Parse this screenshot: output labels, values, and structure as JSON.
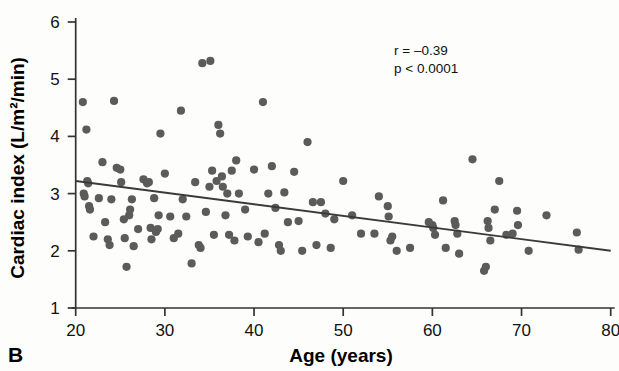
{
  "panel": {
    "label": "B"
  },
  "annotations": {
    "correlation": "r = –0.39",
    "pvalue": "p < 0.0001"
  },
  "chart_data": {
    "type": "scatter",
    "title": "",
    "xlabel": "Age (years)",
    "ylabel": "Cardiac index (L/m²/min)",
    "xlim": [
      20,
      80
    ],
    "ylim": [
      1,
      6
    ],
    "xticks": [
      20,
      30,
      40,
      50,
      60,
      70,
      80
    ],
    "xticklabels": [
      "20",
      "30",
      "40",
      "50",
      "60",
      "70",
      "80"
    ],
    "yticks": [
      1,
      2,
      3,
      4,
      5,
      6
    ],
    "yticklabels": [
      "1",
      "2",
      "3",
      "4",
      "5",
      "6"
    ],
    "grid": false,
    "legend": null,
    "marker_color": "#5b5b5b",
    "line_color": "#3a3a3a",
    "axis_color": "#333333",
    "trendline": {
      "type": "linear",
      "x": [
        20,
        80
      ],
      "y": [
        3.22,
        2.0
      ],
      "r": -0.39,
      "p": "<0.0001"
    },
    "points": [
      [
        20.8,
        4.6
      ],
      [
        20.9,
        3.0
      ],
      [
        21.0,
        2.95
      ],
      [
        21.2,
        4.12
      ],
      [
        21.3,
        3.22
      ],
      [
        21.4,
        3.18
      ],
      [
        21.5,
        2.78
      ],
      [
        21.6,
        2.72
      ],
      [
        22.0,
        2.25
      ],
      [
        22.6,
        2.92
      ],
      [
        23.0,
        3.55
      ],
      [
        23.3,
        2.5
      ],
      [
        23.6,
        2.2
      ],
      [
        23.8,
        2.1
      ],
      [
        24.0,
        2.9
      ],
      [
        24.3,
        4.62
      ],
      [
        24.6,
        3.45
      ],
      [
        25.0,
        3.42
      ],
      [
        25.1,
        3.2
      ],
      [
        25.4,
        2.55
      ],
      [
        25.5,
        2.22
      ],
      [
        25.7,
        1.72
      ],
      [
        26.0,
        2.62
      ],
      [
        26.1,
        2.72
      ],
      [
        26.3,
        2.9
      ],
      [
        26.5,
        2.08
      ],
      [
        27.0,
        2.38
      ],
      [
        27.6,
        3.25
      ],
      [
        28.0,
        3.18
      ],
      [
        28.2,
        3.2
      ],
      [
        28.4,
        2.4
      ],
      [
        28.5,
        2.2
      ],
      [
        28.8,
        2.92
      ],
      [
        29.0,
        2.33
      ],
      [
        29.2,
        2.38
      ],
      [
        29.3,
        2.62
      ],
      [
        29.5,
        4.05
      ],
      [
        30.0,
        3.35
      ],
      [
        30.6,
        2.6
      ],
      [
        31.0,
        2.22
      ],
      [
        31.5,
        2.3
      ],
      [
        31.8,
        4.45
      ],
      [
        32.0,
        2.9
      ],
      [
        32.4,
        2.6
      ],
      [
        33.0,
        1.78
      ],
      [
        33.4,
        3.2
      ],
      [
        33.8,
        2.1
      ],
      [
        34.0,
        2.05
      ],
      [
        34.2,
        5.28
      ],
      [
        35.1,
        5.32
      ],
      [
        34.6,
        2.68
      ],
      [
        35.0,
        3.12
      ],
      [
        35.3,
        3.4
      ],
      [
        35.5,
        2.28
      ],
      [
        35.8,
        3.22
      ],
      [
        36.0,
        4.2
      ],
      [
        36.2,
        4.05
      ],
      [
        36.4,
        3.3
      ],
      [
        36.5,
        3.12
      ],
      [
        36.8,
        2.62
      ],
      [
        37.0,
        3.0
      ],
      [
        37.2,
        2.28
      ],
      [
        37.5,
        3.4
      ],
      [
        37.8,
        2.18
      ],
      [
        38.0,
        3.58
      ],
      [
        38.3,
        3.0
      ],
      [
        39.0,
        2.72
      ],
      [
        39.3,
        2.25
      ],
      [
        40.0,
        3.42
      ],
      [
        40.5,
        2.15
      ],
      [
        41.0,
        4.6
      ],
      [
        41.2,
        2.3
      ],
      [
        41.6,
        3.0
      ],
      [
        42.0,
        3.48
      ],
      [
        42.4,
        2.75
      ],
      [
        42.8,
        2.1
      ],
      [
        43.0,
        2.0
      ],
      [
        43.4,
        3.02
      ],
      [
        43.8,
        2.5
      ],
      [
        44.5,
        3.38
      ],
      [
        45.0,
        2.52
      ],
      [
        45.4,
        2.0
      ],
      [
        46.0,
        3.9
      ],
      [
        46.6,
        2.85
      ],
      [
        47.0,
        2.1
      ],
      [
        47.5,
        2.85
      ],
      [
        48.0,
        2.65
      ],
      [
        48.6,
        2.05
      ],
      [
        49.0,
        2.55
      ],
      [
        50.0,
        3.22
      ],
      [
        51.0,
        2.62
      ],
      [
        52.0,
        2.3
      ],
      [
        53.5,
        2.3
      ],
      [
        54.0,
        2.95
      ],
      [
        55.0,
        2.78
      ],
      [
        55.1,
        2.6
      ],
      [
        55.3,
        2.18
      ],
      [
        55.5,
        2.25
      ],
      [
        56.0,
        2.0
      ],
      [
        57.5,
        2.05
      ],
      [
        59.6,
        2.5
      ],
      [
        60.0,
        2.45
      ],
      [
        60.1,
        2.4
      ],
      [
        60.3,
        2.28
      ],
      [
        61.2,
        2.88
      ],
      [
        61.5,
        2.05
      ],
      [
        62.5,
        2.52
      ],
      [
        62.6,
        2.45
      ],
      [
        62.8,
        2.3
      ],
      [
        63.0,
        1.95
      ],
      [
        64.5,
        3.6
      ],
      [
        65.8,
        1.65
      ],
      [
        66.0,
        1.72
      ],
      [
        66.2,
        2.52
      ],
      [
        66.3,
        2.4
      ],
      [
        66.5,
        2.18
      ],
      [
        67.0,
        2.72
      ],
      [
        67.5,
        3.22
      ],
      [
        68.3,
        2.28
      ],
      [
        69.0,
        2.3
      ],
      [
        69.5,
        2.7
      ],
      [
        69.6,
        2.45
      ],
      [
        70.8,
        2.0
      ],
      [
        72.8,
        2.62
      ],
      [
        76.2,
        2.32
      ],
      [
        76.4,
        2.02
      ]
    ]
  }
}
